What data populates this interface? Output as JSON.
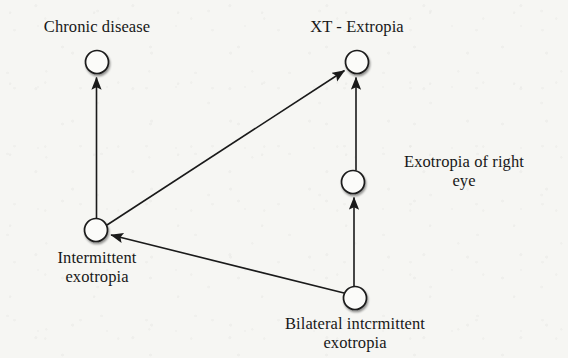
{
  "diagram": {
    "background_color": "#f6f6f3",
    "stroke_color": "#1a1a1a",
    "node_fill_color": "#fbfbf9",
    "nodes": [
      {
        "id": "chronic-disease",
        "label": "Chronic disease",
        "label_lines": [
          "Chronic disease"
        ],
        "cx": 97,
        "cy": 62,
        "r": 11.5,
        "label_position": "above"
      },
      {
        "id": "xt-extropia",
        "label": "XT - Extropia",
        "label_lines": [
          "XT - Extropia"
        ],
        "cx": 357,
        "cy": 62,
        "r": 11.5,
        "label_position": "above"
      },
      {
        "id": "exotropia-right-eye",
        "label": "Exotropia of right eye",
        "label_lines": [
          "Exotropia of right",
          "eye"
        ],
        "cx": 353,
        "cy": 182,
        "r": 11.5,
        "label_position": "right"
      },
      {
        "id": "intermittent-exotropia",
        "label": "Intermittent exotropia",
        "label_lines": [
          "Intermittent",
          "exotropia"
        ],
        "cx": 96,
        "cy": 230,
        "r": 11.5,
        "label_position": "below"
      },
      {
        "id": "bilateral-intermittent-exotropia",
        "label": "Bilateral intcrmittent exotropia",
        "label_lines": [
          "Bilateral intcrmittent",
          "exotropia"
        ],
        "cx": 355,
        "cy": 298,
        "r": 11.5,
        "label_position": "below"
      }
    ],
    "edges": [
      {
        "id": "edge-intermittent-to-chronic",
        "from": "intermittent-exotropia",
        "to": "chronic-disease",
        "arrowhead": "to"
      },
      {
        "id": "edge-intermittent-to-xt",
        "from": "intermittent-exotropia",
        "to": "xt-extropia",
        "arrowhead": "to"
      },
      {
        "id": "edge-exotropia-right-to-xt",
        "from": "exotropia-right-eye",
        "to": "xt-extropia",
        "arrowhead": "to"
      },
      {
        "id": "edge-bilateral-to-exotropia-right",
        "from": "bilateral-intermittent-exotropia",
        "to": "exotropia-right-eye",
        "arrowhead": "to"
      },
      {
        "id": "edge-bilateral-to-intermittent",
        "from": "bilateral-intermittent-exotropia",
        "to": "intermittent-exotropia",
        "arrowhead": "to"
      }
    ]
  },
  "labels": {
    "chronic_disease": "Chronic disease",
    "xt_extropia": "XT - Extropia",
    "exotropia_right_eye_line1": "Exotropia of right",
    "exotropia_right_eye_line2": "eye",
    "intermittent_exotropia_line1": "Intermittent",
    "intermittent_exotropia_line2": "exotropia",
    "bilateral_line1": "Bilateral intcrmittent",
    "bilateral_line2": "exotropia"
  }
}
